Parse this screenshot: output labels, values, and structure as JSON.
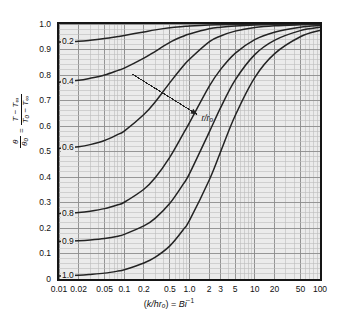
{
  "chart_data": {
    "type": "line",
    "title": "",
    "xlabel": "(k/hrₒ) = Bi⁻¹",
    "ylabel": "θ/θₒ = (T − T∞)/(Tₒ − T∞)",
    "xscale": "log",
    "xlim": [
      0.01,
      100
    ],
    "ylim": [
      0,
      1.0
    ],
    "grid": true,
    "legend": "none",
    "annotation": "r/rₒ",
    "xticks": [
      "0.01",
      "0.02",
      "0.05",
      "0.1",
      "0.2",
      "0.5",
      "1.0",
      "2",
      "3",
      "5",
      "10",
      "20",
      "50",
      "100"
    ],
    "xtick_values": [
      0.01,
      0.02,
      0.05,
      0.1,
      0.2,
      0.5,
      1.0,
      2,
      3,
      5,
      10,
      20,
      50,
      100
    ],
    "yticks": [
      "0",
      "0.1",
      "0.2",
      "0.3",
      "0.4",
      "0.5",
      "0.6",
      "0.7",
      "0.8",
      "0.9",
      "1.0"
    ],
    "ytick_values": [
      0,
      0.1,
      0.2,
      0.3,
      0.4,
      0.5,
      0.6,
      0.7,
      0.8,
      0.9,
      1.0
    ],
    "series": [
      {
        "name": "0.2",
        "label": "0.2",
        "x": [
          0.01,
          0.02,
          0.03,
          0.05,
          0.08,
          0.1,
          0.2,
          0.3,
          0.5,
          0.8,
          1.0,
          2,
          3,
          5,
          10,
          20,
          50,
          100
        ],
        "values": [
          0.929,
          0.932,
          0.936,
          0.943,
          0.951,
          0.955,
          0.969,
          0.977,
          0.985,
          0.99,
          0.992,
          0.996,
          0.997,
          0.998,
          0.999,
          1.0,
          1.0,
          1.0
        ]
      },
      {
        "name": "0.4",
        "label": "0.4",
        "x": [
          0.01,
          0.02,
          0.03,
          0.05,
          0.08,
          0.1,
          0.2,
          0.3,
          0.5,
          0.8,
          1.0,
          2,
          3,
          5,
          10,
          20,
          50,
          100
        ],
        "values": [
          0.772,
          0.779,
          0.787,
          0.8,
          0.818,
          0.827,
          0.866,
          0.893,
          0.928,
          0.952,
          0.961,
          0.981,
          0.987,
          0.992,
          0.996,
          0.998,
          0.999,
          1.0
        ]
      },
      {
        "name": "0.6",
        "label": "0.6",
        "x": [
          0.01,
          0.02,
          0.03,
          0.05,
          0.08,
          0.1,
          0.2,
          0.3,
          0.5,
          0.8,
          1.0,
          2,
          3,
          5,
          10,
          20,
          50,
          100
        ],
        "values": [
          0.512,
          0.519,
          0.527,
          0.543,
          0.567,
          0.58,
          0.645,
          0.695,
          0.77,
          0.835,
          0.862,
          0.93,
          0.953,
          0.972,
          0.986,
          0.993,
          0.997,
          0.999
        ]
      },
      {
        "name": "0.8",
        "label": "0.8",
        "x": [
          0.01,
          0.02,
          0.03,
          0.05,
          0.08,
          0.1,
          0.2,
          0.3,
          0.5,
          0.8,
          1.0,
          2,
          3,
          5,
          10,
          20,
          50,
          100
        ],
        "values": [
          0.257,
          0.261,
          0.266,
          0.276,
          0.291,
          0.301,
          0.352,
          0.398,
          0.478,
          0.569,
          0.613,
          0.755,
          0.822,
          0.885,
          0.939,
          0.968,
          0.987,
          0.994
        ]
      },
      {
        "name": "0.9",
        "label": "0.9",
        "x": [
          0.01,
          0.02,
          0.03,
          0.05,
          0.08,
          0.1,
          0.2,
          0.3,
          0.5,
          0.8,
          1.0,
          2,
          3,
          5,
          10,
          20,
          50,
          100
        ],
        "values": [
          0.147,
          0.15,
          0.153,
          0.159,
          0.168,
          0.175,
          0.208,
          0.239,
          0.297,
          0.372,
          0.413,
          0.575,
          0.672,
          0.78,
          0.88,
          0.936,
          0.974,
          0.987
        ]
      },
      {
        "name": "1.0",
        "label": "1.0",
        "x": [
          0.01,
          0.02,
          0.03,
          0.05,
          0.08,
          0.1,
          0.2,
          0.3,
          0.5,
          0.8,
          1.0,
          2,
          3,
          5,
          10,
          20,
          50,
          100
        ],
        "values": [
          0.012,
          0.015,
          0.018,
          0.023,
          0.031,
          0.036,
          0.063,
          0.086,
          0.13,
          0.193,
          0.23,
          0.387,
          0.499,
          0.64,
          0.79,
          0.883,
          0.95,
          0.975
        ]
      }
    ]
  },
  "axis": {
    "x_title_prefix": "(",
    "x_title_k": "k/hr",
    "x_title_sub": "o",
    "x_title_mid": ") = ",
    "x_title_bi": "Bi",
    "x_title_sup": "−1",
    "y_theta": "θ",
    "y_theta_sub": "o",
    "y_eq": "=",
    "y_num_T": "T",
    "y_num_minus": " − ",
    "y_num_Tinf": "T",
    "y_num_inf_sub": "∞",
    "y_den_T0": "T",
    "y_den_0_sub": "o",
    "y_den_minus": " − ",
    "y_den_Tinf": "T",
    "y_den_inf_sub": "∞"
  },
  "annotation": {
    "label_r": "r",
    "label_slash": "/",
    "label_r0": "r",
    "label_r0_sub": "o"
  },
  "style": {
    "plot_background": "#ebebeb",
    "frame_color": "#151515",
    "curve_color": "#232323",
    "major_grid": "#8d8d8d",
    "minor_grid": "#bdbdbd",
    "text_color": "#111111"
  }
}
